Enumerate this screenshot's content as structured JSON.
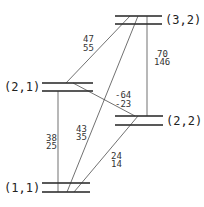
{
  "diagram": {
    "levels": [
      {
        "id": "3_2",
        "label": "(3,2)"
      },
      {
        "id": "2_1",
        "label": "(2,1)"
      },
      {
        "id": "2_2",
        "label": "(2,2)"
      },
      {
        "id": "1_1",
        "label": "(1,1)"
      }
    ],
    "transitions": [
      {
        "from": "(3,2)",
        "to": "(2,1)",
        "top": "47",
        "bottom": "55"
      },
      {
        "from": "(3,2)",
        "to": "(2,2)",
        "top": "70",
        "bottom": "146"
      },
      {
        "from": "(2,1)",
        "to": "(2,2)",
        "top": "-64",
        "bottom": "-23"
      },
      {
        "from": "(2,1)",
        "to": "(1,1)",
        "top": "38",
        "bottom": "25"
      },
      {
        "from": "(3,2)",
        "to": "(1,1)",
        "top": "43",
        "bottom": "35"
      },
      {
        "from": "(2,2)",
        "to": "(1,1)",
        "top": "24",
        "bottom": "14"
      }
    ]
  }
}
